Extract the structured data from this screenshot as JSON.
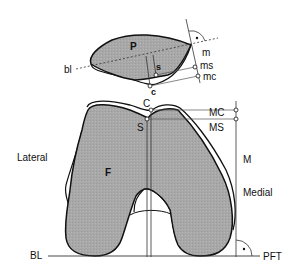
{
  "diagram": {
    "type": "anatomical-measurement-diagram",
    "colors": {
      "bone_fill": "#a9a9a9",
      "outline": "#111111",
      "guide_line": "#555555",
      "background": "#ffffff"
    },
    "patella": {
      "label": "P",
      "baseline_label": "bl",
      "labels": {
        "m": "m",
        "ms": "ms",
        "mc": "mc",
        "s": "s",
        "c": "c"
      }
    },
    "femur": {
      "label": "F",
      "labels": {
        "C": "C",
        "S": "S",
        "MC": "MC",
        "MS": "MS",
        "M": "M"
      }
    },
    "sides": {
      "lateral": "Lateral",
      "medial": "Medial"
    },
    "baseline": {
      "left_label": "BL",
      "right_label": "PFT"
    }
  }
}
